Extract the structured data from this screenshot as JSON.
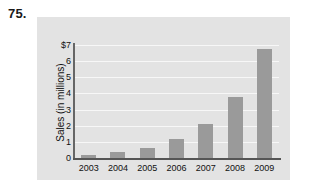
{
  "problem": {
    "number": "75."
  },
  "chart_data": {
    "type": "bar",
    "title": "",
    "xlabel": "",
    "ylabel": "Sales (in millions)",
    "categories": [
      "2003",
      "2004",
      "2005",
      "2006",
      "2007",
      "2008",
      "2009"
    ],
    "values": [
      0.2,
      0.35,
      0.6,
      1.15,
      2.1,
      3.8,
      6.75
    ],
    "ylim": [
      0,
      7
    ],
    "ytick_labels": [
      "$7",
      "6",
      "5",
      "4",
      "3",
      "2",
      "1",
      "0"
    ],
    "ytick_values": [
      7,
      6,
      5,
      4,
      3,
      2,
      1,
      0
    ],
    "grid": true,
    "legend": "none",
    "colors": {
      "bar": "#9a9a9a",
      "panel_background": "#e3e3e3",
      "gridline": "#f7f7f7",
      "axis": "#555555",
      "text": "#111111"
    }
  }
}
